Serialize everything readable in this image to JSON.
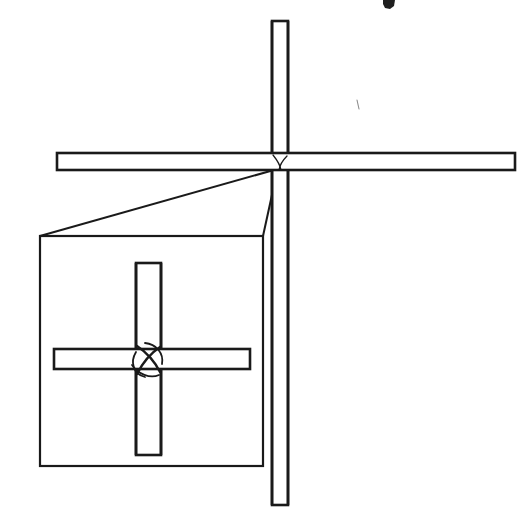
{
  "figure": {
    "kind": "technical-line-drawing",
    "title_visible": false,
    "background_color": "#ffffff",
    "line_color": "#1a1a1a",
    "canvas": {
      "width": 525,
      "height": 521
    },
    "description": "Cross-shaped frame of two crossed bars with a rectangular detail callout box magnifying the crossing joint"
  },
  "main_assembly": {
    "name": "crossed-bar-assembly",
    "vertical_bar": {
      "label": "vertical-bar",
      "x": 272,
      "y": 21,
      "width": 16,
      "height": 484,
      "fill": "#ffffff"
    },
    "horizontal_bar": {
      "label": "horizontal-bar",
      "x": 57,
      "y": 153,
      "width": 458,
      "height": 17,
      "fill": "#ffffff"
    },
    "joint": {
      "label": "crossing-joint",
      "center_x": 280,
      "center_y": 166
    }
  },
  "detail_callout": {
    "name": "detail-view-box",
    "box": {
      "x": 40,
      "y": 236,
      "width": 223,
      "height": 230
    },
    "leader_lines": [
      {
        "from_x": 274,
        "from_y": 170,
        "to_x": 40,
        "to_y": 236
      },
      {
        "from_x": 277,
        "from_y": 172,
        "to_x": 263,
        "to_y": 236
      }
    ],
    "magnified_joint": {
      "vertical_bar": {
        "x": 136,
        "y": 263,
        "width": 25,
        "height": 192
      },
      "horizontal_bar": {
        "x": 54,
        "y": 349,
        "width": 196,
        "height": 20
      },
      "weave_center_x": 148,
      "weave_center_y": 359,
      "weave_description": "interlaced lashing curves crossing over the bar intersection"
    }
  },
  "marks": {
    "top_crop_mark": {
      "name": "cropped-glyph-fragment",
      "x": 383,
      "y": 0,
      "width": 12,
      "height": 9
    },
    "faint_tick": {
      "name": "faint-speck",
      "x": 357,
      "y": 100,
      "length": 9
    }
  }
}
